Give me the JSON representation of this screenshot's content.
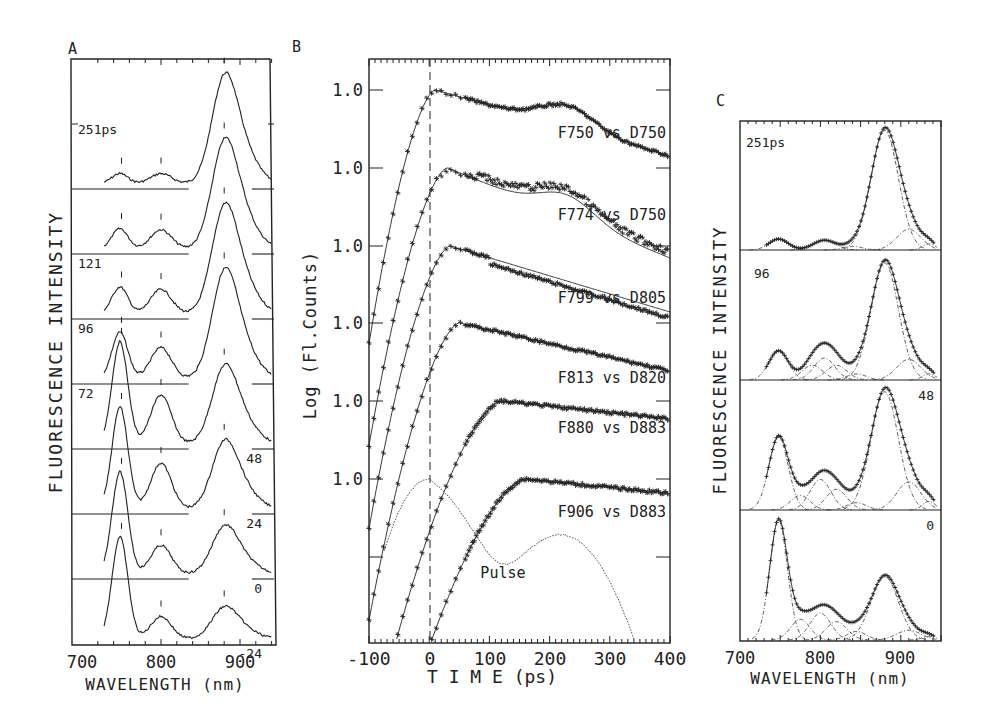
{
  "figure": {
    "panel_labels": [
      "A",
      "B",
      "C"
    ]
  },
  "chart_data": [
    {
      "panel": "A",
      "type": "line",
      "title": "",
      "xlabel": "WAVELENGTH (nm)",
      "ylabel": "FLUORESCENCE INTENSITY",
      "xlim": [
        700,
        950
      ],
      "xticks": [
        700,
        800,
        900
      ],
      "x_tick_labels": [
        "700",
        "800",
        "900"
      ],
      "description": "Stacked time-resolved fluorescence spectra, offset vertically; vertical marks indicate peak positions (~750, ~800, ~880 nm)",
      "peak_markers_nm": [
        750,
        800,
        880
      ],
      "series": [
        {
          "name": "251ps",
          "label": "251ps",
          "peaks": [
            {
              "x": 750,
              "y": 0.09
            },
            {
              "x": 800,
              "y": 0.09
            },
            {
              "x": 880,
              "y": 1.0
            }
          ]
        },
        {
          "name": "121",
          "label": "121",
          "peaks": [
            {
              "x": 750,
              "y": 0.18
            },
            {
              "x": 800,
              "y": 0.17
            },
            {
              "x": 880,
              "y": 1.0
            }
          ]
        },
        {
          "name": "96",
          "label": "96",
          "peaks": [
            {
              "x": 750,
              "y": 0.24
            },
            {
              "x": 800,
              "y": 0.22
            },
            {
              "x": 880,
              "y": 1.0
            }
          ]
        },
        {
          "name": "72",
          "label": "72",
          "peaks": [
            {
              "x": 750,
              "y": 0.42
            },
            {
              "x": 800,
              "y": 0.28
            },
            {
              "x": 880,
              "y": 1.0
            }
          ]
        },
        {
          "name": "48",
          "label": "48",
          "peaks": [
            {
              "x": 750,
              "y": 1.0
            },
            {
              "x": 800,
              "y": 0.48
            },
            {
              "x": 880,
              "y": 0.78
            }
          ]
        },
        {
          "name": "24",
          "label": "24",
          "peaks": [
            {
              "x": 750,
              "y": 1.0
            },
            {
              "x": 800,
              "y": 0.45
            },
            {
              "x": 880,
              "y": 0.68
            }
          ]
        },
        {
          "name": "0",
          "label": "0",
          "peaks": [
            {
              "x": 750,
              "y": 1.0
            },
            {
              "x": 800,
              "y": 0.28
            },
            {
              "x": 880,
              "y": 0.48
            }
          ]
        },
        {
          "name": "-24",
          "label": "-24",
          "peaks": [
            {
              "x": 750,
              "y": 1.0
            },
            {
              "x": 800,
              "y": 0.22
            },
            {
              "x": 880,
              "y": 0.32
            }
          ]
        }
      ]
    },
    {
      "panel": "B",
      "type": "line",
      "title": "",
      "xlabel": "T I M E (ps)",
      "ylabel": "Log (Fl.Counts)",
      "xlim": [
        -100,
        400
      ],
      "xticks": [
        -100,
        0,
        100,
        200,
        300,
        400
      ],
      "x_tick_labels": [
        "-100",
        "0",
        "100",
        "200",
        "300",
        "400"
      ],
      "y_tick_label": "1.0",
      "y_tick_count": 6,
      "time_zero_marker": 0,
      "description": "Stacked normalized log fluorescence decays (stars = data, solid = fit), each offset with its own 1.0 reference",
      "series": [
        {
          "name": "F750 vs D750",
          "label": "F750 vs D750",
          "peak_time_ps": 10,
          "shoulder_time_ps": 230,
          "end_level": -0.55
        },
        {
          "name": "F774 vs D750",
          "label": "F774 vs D750",
          "peak_time_ps": 30,
          "shoulder_time_ps": 230,
          "end_level": -0.75
        },
        {
          "name": "F799 vs D805",
          "label": "F799 vs D805",
          "peak_time_ps": 35,
          "shoulder_time_ps": 0,
          "end_level": -0.55
        },
        {
          "name": "F813 vs D820",
          "label": "F813 vs D820",
          "peak_time_ps": 50,
          "shoulder_time_ps": 0,
          "end_level": -0.4
        },
        {
          "name": "F880 vs D883",
          "label": "F880 vs D883",
          "peak_time_ps": 120,
          "shoulder_time_ps": 0,
          "end_level": -0.15
        },
        {
          "name": "F906 vs D883",
          "label": "F906 vs D883",
          "peak_time_ps": 160,
          "shoulder_time_ps": 0,
          "end_level": -0.12
        },
        {
          "name": "Pulse",
          "label": "Pulse",
          "peak_time_ps": 0,
          "shoulder_time_ps": 220,
          "end_level": -0.85
        }
      ]
    },
    {
      "panel": "C",
      "type": "line",
      "title": "",
      "xlabel": "WAVELENGTH (nm)",
      "ylabel": "FLUORESCENCE INTENSITY",
      "xlim": [
        700,
        950
      ],
      "xticks": [
        700,
        800,
        900
      ],
      "x_tick_labels": [
        "700",
        "800",
        "900"
      ],
      "description": "Gaussian decomposition of spectra: data (+), total fit (solid), components (dash-dot)",
      "series": [
        {
          "name": "251ps",
          "label": "251ps",
          "label_pos": "left",
          "components": [
            {
              "center": 748,
              "height": 0.09,
              "width": 12
            },
            {
              "center": 805,
              "height": 0.08,
              "width": 14
            },
            {
              "center": 840,
              "height": 0.03,
              "width": 12
            },
            {
              "center": 880,
              "height": 0.98,
              "width": 17
            },
            {
              "center": 910,
              "height": 0.17,
              "width": 15
            },
            {
              "center": 935,
              "height": 0.05,
              "width": 8
            }
          ]
        },
        {
          "name": "96",
          "label": "96",
          "label_pos": "left",
          "components": [
            {
              "center": 748,
              "height": 0.24,
              "width": 12
            },
            {
              "center": 790,
              "height": 0.12,
              "width": 13
            },
            {
              "center": 805,
              "height": 0.18,
              "width": 13
            },
            {
              "center": 820,
              "height": 0.12,
              "width": 13
            },
            {
              "center": 845,
              "height": 0.05,
              "width": 12
            },
            {
              "center": 880,
              "height": 0.96,
              "width": 17
            },
            {
              "center": 910,
              "height": 0.17,
              "width": 15
            },
            {
              "center": 935,
              "height": 0.05,
              "width": 8
            }
          ]
        },
        {
          "name": "48",
          "label": "48",
          "label_pos": "right",
          "components": [
            {
              "center": 748,
              "height": 0.6,
              "width": 12
            },
            {
              "center": 775,
              "height": 0.12,
              "width": 12
            },
            {
              "center": 800,
              "height": 0.25,
              "width": 13
            },
            {
              "center": 820,
              "height": 0.17,
              "width": 13
            },
            {
              "center": 845,
              "height": 0.06,
              "width": 12
            },
            {
              "center": 880,
              "height": 0.97,
              "width": 17
            },
            {
              "center": 910,
              "height": 0.23,
              "width": 15
            },
            {
              "center": 935,
              "height": 0.07,
              "width": 8
            }
          ]
        },
        {
          "name": "0",
          "label": "0",
          "label_pos": "right",
          "components": [
            {
              "center": 748,
              "height": 0.98,
              "width": 11
            },
            {
              "center": 775,
              "height": 0.17,
              "width": 12
            },
            {
              "center": 800,
              "height": 0.22,
              "width": 13
            },
            {
              "center": 820,
              "height": 0.15,
              "width": 13
            },
            {
              "center": 845,
              "height": 0.07,
              "width": 12
            },
            {
              "center": 880,
              "height": 0.52,
              "width": 17
            },
            {
              "center": 910,
              "height": 0.08,
              "width": 15
            },
            {
              "center": 935,
              "height": 0.03,
              "width": 8
            }
          ]
        }
      ]
    }
  ]
}
